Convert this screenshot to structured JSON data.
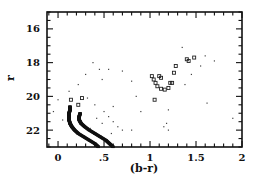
{
  "chart_data": {
    "type": "scatter",
    "title": "",
    "xlabel": "(b-r)",
    "ylabel": "r",
    "xlim": [
      -0.12,
      2.0
    ],
    "ylim": [
      23,
      15
    ],
    "y_inverted": true,
    "grid": false,
    "legend": null,
    "x_ticks": [
      {
        "v": 0,
        "label": "0"
      },
      {
        "v": 0.5,
        "label": ".5"
      },
      {
        "v": 1,
        "label": "1"
      },
      {
        "v": 1.5,
        "label": "1.5"
      },
      {
        "v": 2,
        "label": "2"
      }
    ],
    "y_ticks": [
      {
        "v": 16,
        "label": "16"
      },
      {
        "v": 18,
        "label": "18"
      },
      {
        "v": 20,
        "label": "20"
      },
      {
        "v": 22,
        "label": "22"
      }
    ],
    "series": [
      {
        "name": "main sequence (blue ridge)",
        "marker": "dense-dots",
        "points": [
          [
            0.13,
            20.6
          ],
          [
            0.13,
            20.8
          ],
          [
            0.12,
            21.0
          ],
          [
            0.12,
            21.2
          ],
          [
            0.12,
            21.4
          ],
          [
            0.13,
            21.6
          ],
          [
            0.15,
            21.8
          ],
          [
            0.18,
            22.0
          ],
          [
            0.22,
            22.2
          ],
          [
            0.28,
            22.4
          ],
          [
            0.34,
            22.6
          ],
          [
            0.4,
            22.8
          ],
          [
            0.44,
            23.0
          ]
        ]
      },
      {
        "name": "main sequence (red ridge)",
        "marker": "dense-dots",
        "points": [
          [
            0.24,
            21.0
          ],
          [
            0.23,
            21.2
          ],
          [
            0.23,
            21.4
          ],
          [
            0.25,
            21.6
          ],
          [
            0.29,
            21.8
          ],
          [
            0.34,
            22.0
          ],
          [
            0.4,
            22.2
          ],
          [
            0.46,
            22.4
          ],
          [
            0.52,
            22.6
          ],
          [
            0.56,
            22.8
          ],
          [
            0.6,
            23.0
          ]
        ]
      },
      {
        "name": "giant branch / clump",
        "marker": "open-square",
        "points": [
          [
            1.02,
            18.8
          ],
          [
            1.04,
            19.0
          ],
          [
            1.06,
            19.2
          ],
          [
            1.08,
            19.4
          ],
          [
            1.12,
            19.55
          ],
          [
            1.16,
            19.6
          ],
          [
            1.2,
            19.5
          ],
          [
            1.1,
            18.8
          ],
          [
            1.12,
            18.9
          ],
          [
            1.22,
            19.2
          ],
          [
            1.24,
            19.2
          ],
          [
            1.26,
            18.6
          ],
          [
            1.28,
            18.2
          ],
          [
            1.4,
            17.8
          ],
          [
            1.42,
            17.9
          ],
          [
            1.48,
            17.7
          ],
          [
            1.05,
            20.2
          ],
          [
            0.14,
            20.2
          ],
          [
            0.26,
            20.1
          ],
          [
            0.22,
            20.5
          ]
        ]
      },
      {
        "name": "field stars",
        "marker": "dot",
        "points": [
          [
            0.38,
            18.0
          ],
          [
            0.3,
            18.7
          ],
          [
            0.45,
            18.4
          ],
          [
            0.55,
            18.4
          ],
          [
            0.7,
            18.5
          ],
          [
            0.8,
            19.1
          ],
          [
            0.12,
            19.7
          ],
          [
            0.22,
            19.3
          ],
          [
            0.48,
            19.0
          ],
          [
            0.6,
            20.6
          ],
          [
            0.0,
            20.2
          ],
          [
            -0.05,
            20.9
          ],
          [
            0.05,
            21.4
          ],
          [
            0.32,
            20.1
          ],
          [
            0.4,
            20.5
          ],
          [
            0.5,
            20.9
          ],
          [
            0.55,
            21.2
          ],
          [
            0.6,
            21.5
          ],
          [
            0.48,
            21.6
          ],
          [
            0.65,
            21.8
          ],
          [
            0.7,
            22.0
          ],
          [
            0.58,
            22.2
          ],
          [
            0.42,
            21.3
          ],
          [
            0.35,
            21.9
          ],
          [
            0.8,
            22.0
          ],
          [
            0.9,
            20.9
          ],
          [
            0.85,
            20.0
          ],
          [
            1.2,
            20.8
          ],
          [
            1.18,
            21.6
          ],
          [
            1.2,
            22.0
          ],
          [
            1.35,
            17.1
          ],
          [
            1.6,
            17.6
          ],
          [
            1.7,
            17.9
          ],
          [
            1.55,
            18.2
          ],
          [
            1.45,
            18.7
          ],
          [
            1.38,
            19.3
          ],
          [
            1.62,
            20.4
          ],
          [
            1.9,
            21.3
          ],
          [
            1.15,
            21.8
          ]
        ]
      }
    ]
  }
}
